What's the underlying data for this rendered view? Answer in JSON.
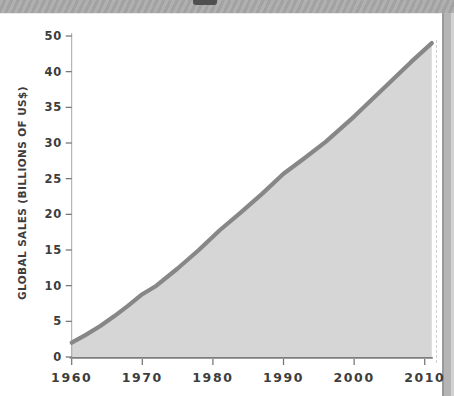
{
  "page": {
    "bg": "#ffffff",
    "top_band_color": "#a9a9a9",
    "notch_color": "#4f4f4f",
    "edge_strip_color": "#b5b5b5"
  },
  "chart_data": {
    "type": "area",
    "title": "",
    "xlabel": "",
    "ylabel": "GLOBAL SALES (BILLIONS OF US$)",
    "x_tick_labels": [
      "1960",
      "1970",
      "1980",
      "1990",
      "2000",
      "2010"
    ],
    "y_tick_labels": [
      "50",
      "40",
      "35",
      "30",
      "25",
      "20",
      "15",
      "10",
      "5",
      "0"
    ],
    "y_units_per_tick_step": 5,
    "x_range": [
      1960,
      2011
    ],
    "y_range": [
      0,
      50
    ],
    "grid": false,
    "legend_position": "none",
    "series": [
      {
        "name": "global-sales",
        "x": [
          1960,
          1962,
          1964,
          1966,
          1968,
          1970,
          1972,
          1975,
          1978,
          1981,
          1984,
          1987,
          1990,
          1993,
          1996,
          2000,
          2004,
          2008,
          2011
        ],
        "y": [
          2,
          3.1,
          4.3,
          5.7,
          7.2,
          8.8,
          10,
          12.4,
          15,
          17.8,
          20.3,
          22.9,
          25.7,
          27.9,
          30.2,
          33.7,
          37.5,
          41.3,
          44
        ]
      }
    ],
    "line_color": "#878787",
    "fill_color": "#d6d6d6",
    "axis_color": "#8f8f8f",
    "tick_color": "#6f6f6f",
    "text_color": "#3d3d3d"
  }
}
